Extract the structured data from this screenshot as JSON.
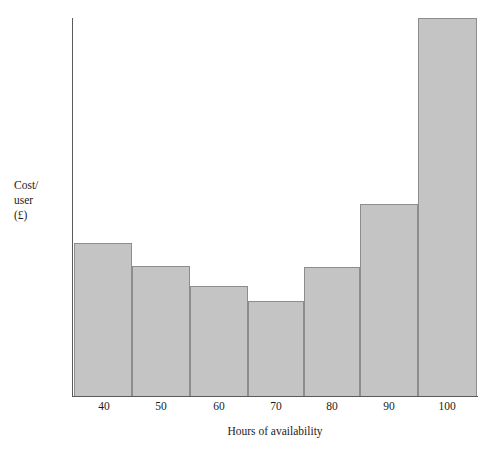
{
  "chart_data": {
    "type": "bar",
    "title": "",
    "xlabel": "Hours of availability",
    "ylabel": "Cost/ user (£)",
    "ylabel_lines": [
      "Cost/",
      "user",
      "(£)"
    ],
    "categories": [
      "40",
      "50",
      "60",
      "70",
      "80",
      "90",
      "100"
    ],
    "values": [
      153,
      130,
      110,
      95,
      129,
      192,
      378
    ],
    "value_unit": "relative cost per user (£), read from bar heights",
    "xlim": [
      35,
      105
    ],
    "ylim": [
      0,
      400
    ],
    "grid": false,
    "legend": null,
    "bar_fill_color": "#c4c4c4",
    "bar_border_color": "#8d8d8d",
    "axis_color": "#5a5a5a",
    "background_color": "#ffffff"
  },
  "axes": {
    "y": {
      "label_lines": [
        "Cost/",
        "user",
        "(£)"
      ],
      "line_top_px": 18,
      "line_bottom_px": 396
    },
    "x": {
      "title": "Hours of availability",
      "ticks": [
        "40",
        "50",
        "60",
        "70",
        "80",
        "90",
        "100"
      ]
    }
  },
  "bars": [
    {
      "category": "40",
      "value": 153,
      "left": 74,
      "width": 58,
      "top": 243,
      "height": 153
    },
    {
      "category": "50",
      "value": 130,
      "left": 132,
      "width": 58,
      "top": 266,
      "height": 130
    },
    {
      "category": "60",
      "value": 110,
      "left": 190,
      "width": 58,
      "top": 286,
      "height": 110
    },
    {
      "category": "70",
      "value": 95,
      "left": 248,
      "width": 56,
      "top": 301,
      "height": 95
    },
    {
      "category": "80",
      "value": 129,
      "left": 304,
      "width": 56,
      "top": 267,
      "height": 129
    },
    {
      "category": "90",
      "value": 192,
      "left": 360,
      "width": 58,
      "top": 204,
      "height": 192
    },
    {
      "category": "100",
      "value": 378,
      "left": 418,
      "width": 59,
      "top": 18,
      "height": 378
    }
  ],
  "tick_positions": [
    104,
    161,
    219,
    276,
    332,
    389,
    447
  ]
}
